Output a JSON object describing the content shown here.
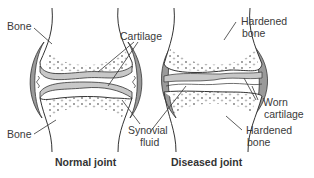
{
  "diagram": {
    "type": "anatomical-comparison",
    "panels": [
      {
        "caption": "Normal joint",
        "labels": {
          "bone_top": "Bone",
          "bone_bottom": "Bone",
          "cartilage": "Cartilage",
          "synovial_line1": "Synovial",
          "synovial_line2": "fluid"
        }
      },
      {
        "caption": "Diseased joint",
        "labels": {
          "hardened_top_line1": "Hardened",
          "hardened_top_line2": "bone",
          "worn_line1": "Worn",
          "worn_line2": "cartilage",
          "hardened_bottom_line1": "Hardened",
          "hardened_bottom_line2": "bone"
        }
      }
    ],
    "colors": {
      "outline": "#333333",
      "capsule_fill": "#9a9a9a",
      "cartilage_fill": "#c8c8c8",
      "bone_fill": "#ffffff",
      "text": "#3a3a3a"
    }
  }
}
